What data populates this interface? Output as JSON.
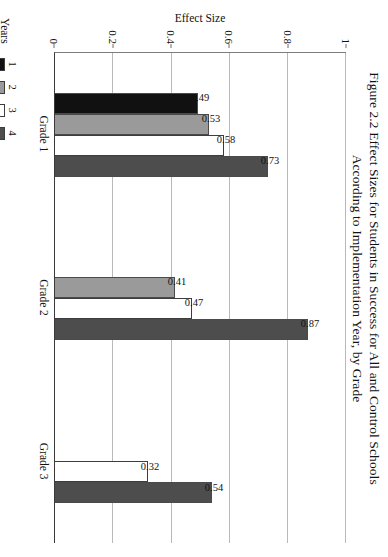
{
  "figure": {
    "title_line1": "Figure 2.2 Effect Sizes for Students in Success for All and Control Schools",
    "title_line2": "According to Implementation Year, by Grade"
  },
  "legend": {
    "title": "Years",
    "items": [
      {
        "label": "1",
        "color": "#111111"
      },
      {
        "label": "2",
        "color": "#9a9a9a"
      },
      {
        "label": "3",
        "color": "#ffffff"
      },
      {
        "label": "4",
        "color": "#4d4d4d"
      }
    ]
  },
  "chart_data": {
    "type": "bar",
    "title": "Figure 2.2 Effect Sizes for Students in Success for All and Control Schools According to Implementation Year, by Grade",
    "orientation": "vertical",
    "xlabel": "",
    "ylabel": "Effect Size",
    "ylim": [
      0,
      1
    ],
    "yticks": [
      "0",
      "0.2",
      "0.4",
      "0.6",
      "0.8",
      "1"
    ],
    "ytick_values": [
      0,
      0.2,
      0.4,
      0.6,
      0.8,
      1
    ],
    "grid": true,
    "legend_position": "bottom-left",
    "categories": [
      "Grade 1",
      "Grade 2",
      "Grade 3"
    ],
    "series": [
      {
        "name": "1",
        "color": "#111111",
        "values": [
          0.49,
          null,
          null
        ],
        "labels": [
          "0.49",
          "",
          ""
        ]
      },
      {
        "name": "2",
        "color": "#9a9a9a",
        "values": [
          0.53,
          0.41,
          null
        ],
        "labels": [
          "0.53",
          "0.41",
          ""
        ]
      },
      {
        "name": "3",
        "color": "#ffffff",
        "values": [
          0.58,
          0.47,
          0.32
        ],
        "labels": [
          "0.58",
          "0.47",
          "0.32"
        ]
      },
      {
        "name": "4",
        "color": "#4d4d4d",
        "values": [
          0.73,
          0.87,
          0.54
        ],
        "labels": [
          "0.73",
          "0.87",
          "0.54"
        ]
      }
    ]
  }
}
